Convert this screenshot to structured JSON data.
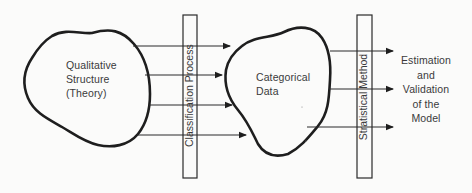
{
  "diagram": {
    "left_node": {
      "lines": [
        "Qualitative",
        "Structure",
        "(Theory)"
      ]
    },
    "process_box": {
      "label": "Classification Process"
    },
    "middle_node": {
      "lines": [
        "Categorical",
        "Data"
      ]
    },
    "method_box": {
      "label": "Stratistical Method"
    },
    "output": {
      "lines": [
        "Estimation",
        "and",
        "Validation",
        "of the",
        "Model"
      ]
    },
    "colors": {
      "stroke": "#1e1e1e",
      "text": "#3a3a3a",
      "background": "#fbfbfa"
    }
  }
}
